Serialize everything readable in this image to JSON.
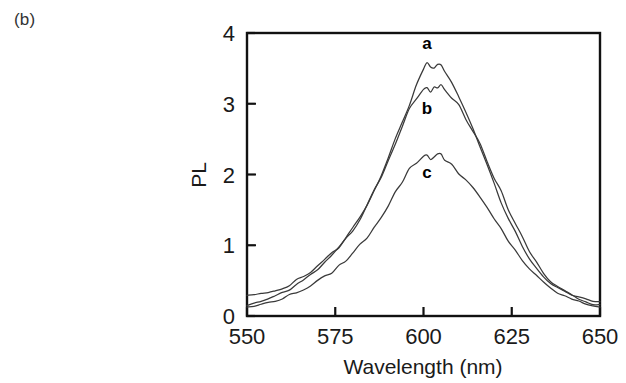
{
  "figure": {
    "panel_label": "(b)"
  },
  "chart_data": {
    "type": "line",
    "title": "",
    "xlabel": "Wavelength (nm)",
    "ylabel": "PL",
    "xlim": [
      550,
      650
    ],
    "ylim": [
      0,
      4
    ],
    "xticks": [
      550,
      575,
      600,
      625,
      650
    ],
    "yticks": [
      0,
      1,
      2,
      3,
      4
    ],
    "xtick_labels": [
      "550",
      "575",
      "600",
      "625",
      "650"
    ],
    "ytick_labels": [
      "0",
      "1",
      "2",
      "3",
      "4"
    ],
    "grid": false,
    "legend": "inline-curve-labels",
    "annotations": [
      {
        "text": "a",
        "x": 601,
        "y": 3.78
      },
      {
        "text": "b",
        "x": 601,
        "y": 2.85
      },
      {
        "text": "c",
        "x": 601,
        "y": 1.95
      }
    ],
    "series": [
      {
        "name": "a",
        "color": "#3a3a3a",
        "x": [
          550,
          552,
          554,
          556,
          558,
          560,
          562,
          564,
          566,
          568,
          570,
          572,
          574,
          576,
          578,
          580,
          582,
          584,
          586,
          588,
          590,
          592,
          594,
          596,
          598,
          600,
          601,
          602,
          603,
          604,
          605,
          606,
          608,
          610,
          612,
          614,
          616,
          618,
          620,
          622,
          624,
          626,
          628,
          630,
          632,
          634,
          636,
          638,
          640,
          642,
          644,
          646,
          648,
          650
        ],
        "values": [
          0.28,
          0.3,
          0.31,
          0.33,
          0.36,
          0.4,
          0.44,
          0.5,
          0.56,
          0.63,
          0.7,
          0.8,
          0.88,
          0.98,
          1.1,
          1.24,
          1.4,
          1.58,
          1.78,
          2.0,
          2.22,
          2.48,
          2.72,
          2.98,
          3.24,
          3.48,
          3.55,
          3.5,
          3.53,
          3.55,
          3.52,
          3.44,
          3.28,
          3.08,
          2.86,
          2.62,
          2.38,
          2.12,
          1.88,
          1.62,
          1.4,
          1.18,
          0.98,
          0.82,
          0.68,
          0.56,
          0.46,
          0.4,
          0.34,
          0.3,
          0.26,
          0.24,
          0.22,
          0.2
        ]
      },
      {
        "name": "b",
        "color": "#3a3a3a",
        "x": [
          550,
          552,
          554,
          556,
          558,
          560,
          562,
          564,
          566,
          568,
          570,
          572,
          574,
          576,
          578,
          580,
          582,
          584,
          586,
          588,
          590,
          592,
          594,
          596,
          598,
          600,
          601,
          602,
          603,
          604,
          605,
          606,
          608,
          610,
          612,
          614,
          616,
          618,
          620,
          622,
          624,
          626,
          628,
          630,
          632,
          634,
          636,
          638,
          640,
          642,
          644,
          646,
          648,
          650
        ],
        "values": [
          0.14,
          0.17,
          0.2,
          0.24,
          0.28,
          0.33,
          0.38,
          0.44,
          0.5,
          0.58,
          0.66,
          0.75,
          0.84,
          0.95,
          1.08,
          1.22,
          1.38,
          1.56,
          1.76,
          1.98,
          2.2,
          2.44,
          2.68,
          2.92,
          3.1,
          3.2,
          3.21,
          3.17,
          3.22,
          3.25,
          3.24,
          3.2,
          3.1,
          2.96,
          2.8,
          2.62,
          2.42,
          2.2,
          1.98,
          1.74,
          1.52,
          1.3,
          1.1,
          0.92,
          0.76,
          0.62,
          0.5,
          0.42,
          0.35,
          0.29,
          0.24,
          0.2,
          0.17,
          0.15
        ]
      },
      {
        "name": "c",
        "color": "#3a3a3a",
        "x": [
          550,
          552,
          554,
          556,
          558,
          560,
          562,
          564,
          566,
          568,
          570,
          572,
          574,
          576,
          578,
          580,
          582,
          584,
          586,
          588,
          590,
          592,
          594,
          596,
          598,
          600,
          601,
          602,
          603,
          604,
          605,
          606,
          608,
          610,
          612,
          614,
          616,
          618,
          620,
          622,
          624,
          626,
          628,
          630,
          632,
          634,
          636,
          638,
          640,
          642,
          644,
          646,
          648,
          650
        ],
        "values": [
          0.12,
          0.14,
          0.16,
          0.19,
          0.22,
          0.25,
          0.29,
          0.33,
          0.38,
          0.43,
          0.49,
          0.55,
          0.62,
          0.7,
          0.79,
          0.89,
          1.0,
          1.12,
          1.26,
          1.41,
          1.57,
          1.74,
          1.91,
          2.06,
          2.18,
          2.26,
          2.27,
          2.24,
          2.26,
          2.28,
          2.26,
          2.22,
          2.14,
          2.04,
          1.92,
          1.8,
          1.66,
          1.52,
          1.37,
          1.22,
          1.07,
          0.93,
          0.79,
          0.67,
          0.56,
          0.47,
          0.39,
          0.33,
          0.28,
          0.24,
          0.2,
          0.17,
          0.15,
          0.13
        ]
      }
    ]
  }
}
